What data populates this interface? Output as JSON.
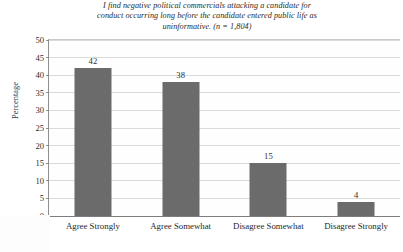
{
  "chart_data": {
    "type": "bar",
    "title": "I find negative political commercials attacking a candidate for conduct occurring long before the candidate entered public life as uninformative. (n = 1,804)",
    "title_lines": [
      "I find negative political commercials attacking a candidate for",
      "conduct occurring long before the candidate entered public life as",
      "uninformative. (n = 1,804)"
    ],
    "xlabel": "",
    "ylabel": "Percentage",
    "categories": [
      "Agree Strongly",
      "Agree Somewhat",
      "Disagree Somewhat",
      "Disagree Strongly"
    ],
    "values": [
      42,
      38,
      15,
      4
    ],
    "value_labels": [
      "42",
      "38",
      "15",
      "4"
    ],
    "ylim": [
      0,
      50
    ],
    "yticks": [
      0,
      5,
      10,
      15,
      20,
      25,
      30,
      35,
      40,
      45,
      50
    ],
    "ytick_labels": [
      "0",
      "5",
      "10",
      "15",
      "20",
      "25",
      "30",
      "35",
      "40",
      "45",
      "50"
    ],
    "grid": true,
    "legend": "none",
    "sample_size": "n = 1,804",
    "bar_color": "#6b6b6b",
    "plot_background": "#fefefe",
    "gridline_color": "#dadada",
    "axis_color": "#7d7d7d"
  }
}
